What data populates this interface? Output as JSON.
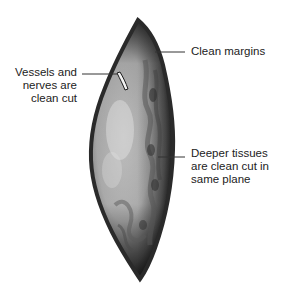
{
  "figure": {
    "colors": {
      "background": "#ffffff",
      "specimen_outline": "#2a2a2a",
      "specimen_fill_light": "#cfcfcf",
      "specimen_fill_dark": "#4a4a4a",
      "leader_line": "#333333",
      "text": "#222222"
    }
  },
  "labels": {
    "clean_margins": "Clean margins",
    "vessels": "Vessels and\nnerves are\nclean cut",
    "deeper": "Deeper tissues\nare clean cut in\nsame plane"
  }
}
